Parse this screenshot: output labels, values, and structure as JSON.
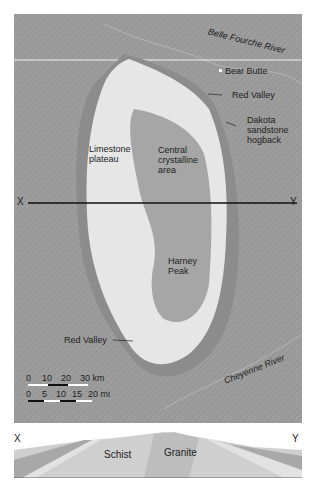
{
  "map": {
    "labels": {
      "belle_fourche": "Belle Fourche River",
      "bear_butte": "Bear Butte",
      "red_valley_north": "Red Valley",
      "dakota_1": "Dakota",
      "dakota_2": "sandstone",
      "dakota_3": "hogback",
      "limestone_1": "Limestone",
      "limestone_2": "plateau",
      "central_1": "Central",
      "central_2": "crystalline",
      "central_3": "area",
      "harney_1": "Harney",
      "harney_2": "Peak",
      "red_valley_south": "Red Valley",
      "cheyenne": "Cheyenne River",
      "x": "X",
      "y": "Y"
    },
    "scale_km": {
      "ticks": [
        "0",
        "10",
        "20",
        "30 km"
      ]
    },
    "scale_mi": {
      "ticks": [
        "0",
        "5",
        "10",
        "15",
        "20 mi"
      ]
    }
  },
  "cross_section": {
    "x": "X",
    "y": "Y",
    "schist": "Schist",
    "granite": "Granite"
  },
  "colors": {
    "plains": "#9a9a9a",
    "limestone": "#e8e8e8",
    "crystalline": "#a8a8a8"
  }
}
